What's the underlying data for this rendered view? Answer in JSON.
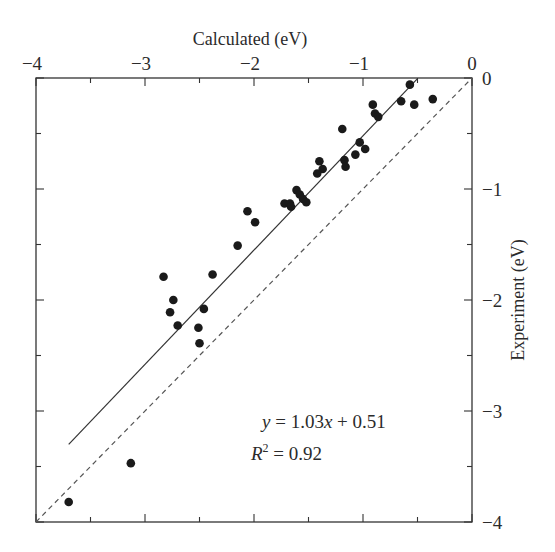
{
  "chart_data": {
    "type": "scatter",
    "title": "",
    "xlabel": "Calculated (eV)",
    "ylabel": "Experiment (eV)",
    "xlim": [
      -4,
      0
    ],
    "ylim": [
      -4,
      0
    ],
    "x_ticks": [
      -4,
      -3,
      -2,
      -1,
      0
    ],
    "x_tick_labels": [
      "−4",
      "−3",
      "−2",
      "−1",
      "0"
    ],
    "y_ticks": [
      0,
      -1,
      -2,
      -3,
      -4
    ],
    "y_tick_labels": [
      "0",
      "−1",
      "−2",
      "−3",
      "−4"
    ],
    "x_axis_position": "top",
    "y_axis_position": "right",
    "grid": false,
    "legend": null,
    "series": [
      {
        "name": "data",
        "marker": "filled-circle",
        "color": "#1a1a1a",
        "points": [
          [
            -0.57,
            -0.06
          ],
          [
            -0.65,
            -0.21
          ],
          [
            -0.53,
            -0.24
          ],
          [
            -0.36,
            -0.19
          ],
          [
            -0.91,
            -0.24
          ],
          [
            -0.89,
            -0.32
          ],
          [
            -0.86,
            -0.35
          ],
          [
            -1.19,
            -0.46
          ],
          [
            -1.03,
            -0.58
          ],
          [
            -0.98,
            -0.64
          ],
          [
            -1.07,
            -0.69
          ],
          [
            -1.17,
            -0.74
          ],
          [
            -1.16,
            -0.8
          ],
          [
            -1.4,
            -0.75
          ],
          [
            -1.37,
            -0.82
          ],
          [
            -1.42,
            -0.86
          ],
          [
            -1.61,
            -1.01
          ],
          [
            -1.58,
            -1.05
          ],
          [
            -1.55,
            -1.09
          ],
          [
            -1.52,
            -1.12
          ],
          [
            -1.72,
            -1.13
          ],
          [
            -1.67,
            -1.13
          ],
          [
            -1.66,
            -1.16
          ],
          [
            -2.06,
            -1.2
          ],
          [
            -1.99,
            -1.3
          ],
          [
            -2.15,
            -1.51
          ],
          [
            -2.83,
            -1.79
          ],
          [
            -2.38,
            -1.77
          ],
          [
            -2.74,
            -2.0
          ],
          [
            -2.77,
            -2.11
          ],
          [
            -2.46,
            -2.08
          ],
          [
            -2.7,
            -2.23
          ],
          [
            -2.51,
            -2.25
          ],
          [
            -2.5,
            -2.39
          ],
          [
            -3.13,
            -3.47
          ],
          [
            -3.7,
            -3.82
          ]
        ]
      },
      {
        "name": "linear fit",
        "type": "line",
        "style": "solid",
        "color": "#333333",
        "slope": 1.03,
        "intercept": 0.51,
        "x_range": [
          -3.7,
          -0.5
        ]
      },
      {
        "name": "y = x",
        "type": "line",
        "style": "dashed",
        "color": "#555555",
        "x_range": [
          -4,
          0
        ]
      }
    ],
    "annotations": [
      {
        "text": "y = 1.03x + 0.51",
        "x": -1.9,
        "y": -3.15
      },
      {
        "text": "R² = 0.92",
        "x": -2.0,
        "y": -3.45
      }
    ]
  },
  "labels": {
    "x_title": "Calculated (eV)",
    "y_title": "Experiment (eV)",
    "eq_y": "y",
    "eq_eq": " = 1.03",
    "eq_x": "x",
    "eq_rest": " + 0.51",
    "r2_R": "R",
    "r2_sup": "2",
    "r2_rest": " = 0.92"
  }
}
